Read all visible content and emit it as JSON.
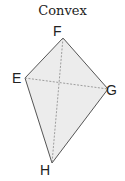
{
  "title": "Convex",
  "shape": {
    "type": "quadrilateral",
    "fill": "#ececec",
    "stroke": "#555555",
    "vertices": [
      {
        "label": "F",
        "x": 63,
        "y": 38
      },
      {
        "label": "G",
        "x": 108,
        "y": 89
      },
      {
        "label": "H",
        "x": 52,
        "y": 163
      },
      {
        "label": "E",
        "x": 25,
        "y": 78
      }
    ],
    "diagonals": [
      [
        "E",
        "G"
      ],
      [
        "F",
        "H"
      ]
    ]
  }
}
